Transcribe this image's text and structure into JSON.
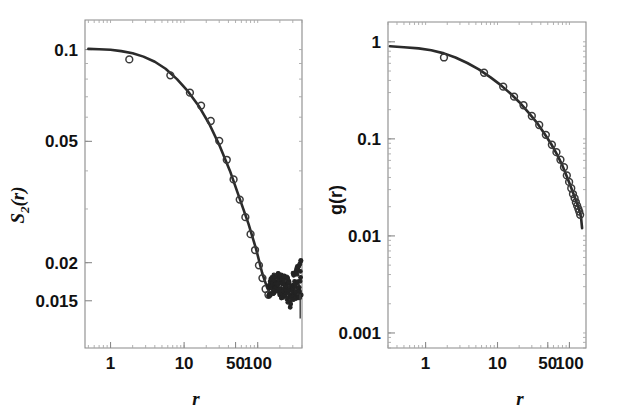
{
  "figure": {
    "title": "",
    "background": "#ffffff",
    "curve_color": "#2b2b2b",
    "marker_color": "#3a3a3a",
    "axis_color": "#8a8a8a"
  },
  "chart_data": [
    {
      "type": "line",
      "panel": "left",
      "title": "",
      "xlabel": "r",
      "ylabel": "S2(r)",
      "ylabel_base": "S",
      "ylabel_sub": "2",
      "ylabel_tail": "(r)",
      "xscale": "log",
      "yscale": "log",
      "xlim": [
        0.45,
        400
      ],
      "ylim": [
        0.0105,
        0.125
      ],
      "grid": false,
      "legend": "none",
      "xticks": [
        1,
        10,
        50,
        100
      ],
      "xticklabels": [
        "1",
        "10",
        "50",
        "100"
      ],
      "yticks": [
        0.1,
        0.05,
        0.02,
        0.015
      ],
      "yticklabels": [
        "0.1",
        "0.05",
        "0.02",
        "0.015"
      ],
      "series": [
        {
          "name": "theory-curve",
          "style": "solid-line",
          "x": [
            0.5,
            0.7,
            1.0,
            1.4,
            2.0,
            2.8,
            4.0,
            5.6,
            8.0,
            11,
            16,
            22,
            30,
            42,
            58,
            75,
            95,
            115,
            135,
            150,
            165,
            185,
            210,
            240,
            270,
            300,
            340,
            380
          ],
          "y": [
            0.1005,
            0.1002,
            0.0998,
            0.0988,
            0.0972,
            0.0948,
            0.0912,
            0.0865,
            0.08,
            0.0735,
            0.065,
            0.057,
            0.0487,
            0.04,
            0.032,
            0.0268,
            0.0222,
            0.0185,
            0.0165,
            0.0158,
            0.0157,
            0.0163,
            0.0166,
            0.0162,
            0.0168,
            0.017,
            0.0172,
            0.0166
          ]
        },
        {
          "name": "simulation-points",
          "style": "open-circles",
          "x": [
            1.8,
            6.5,
            12,
            17,
            23,
            30,
            38,
            47,
            57,
            68,
            80,
            92,
            104,
            116,
            128,
            140
          ],
          "y": [
            0.0928,
            0.0823,
            0.0722,
            0.0655,
            0.0583,
            0.0502,
            0.0435,
            0.0375,
            0.0322,
            0.0282,
            0.0248,
            0.022,
            0.0196,
            0.0178,
            0.0164,
            0.0157
          ]
        },
        {
          "name": "noisy-tail",
          "style": "dense-noisy-markers",
          "x_range": [
            140,
            390
          ],
          "y_range": [
            0.015,
            0.0185
          ],
          "description": "dense scatter plateau with fluctuations"
        }
      ]
    },
    {
      "type": "line",
      "panel": "right",
      "title": "",
      "xlabel": "r",
      "ylabel": "g(r)",
      "xscale": "log",
      "yscale": "log",
      "xlim": [
        0.3,
        170
      ],
      "ylim": [
        0.0007,
        1.6
      ],
      "grid": false,
      "legend": "none",
      "xticks": [
        1,
        10,
        50,
        100
      ],
      "xticklabels": [
        "1",
        "10",
        "50",
        "100"
      ],
      "yticks": [
        1,
        0.1,
        0.01,
        0.001
      ],
      "yticklabels": [
        "1",
        "0.1",
        "0.01",
        "0.001"
      ],
      "series": [
        {
          "name": "theory-curve",
          "style": "solid-line",
          "x": [
            0.32,
            0.5,
            0.8,
            1.2,
            1.8,
            2.6,
            3.8,
            5.5,
            8.0,
            11,
            15,
            20,
            27,
            35,
            45,
            56,
            68,
            80,
            92,
            103,
            112,
            120,
            128,
            134,
            140,
            145,
            150
          ],
          "y": [
            0.9,
            0.88,
            0.855,
            0.82,
            0.76,
            0.69,
            0.605,
            0.52,
            0.43,
            0.36,
            0.295,
            0.24,
            0.186,
            0.148,
            0.113,
            0.088,
            0.068,
            0.053,
            0.041,
            0.033,
            0.028,
            0.0245,
            0.0215,
            0.0195,
            0.0175,
            0.0155,
            0.012
          ]
        },
        {
          "name": "simulation-points",
          "style": "open-circles",
          "x": [
            1.8,
            6.5,
            12,
            17,
            23,
            30,
            38,
            47,
            57,
            66,
            75,
            84,
            92,
            99,
            106,
            112,
            118,
            123,
            128,
            133,
            137,
            141
          ],
          "y": [
            0.69,
            0.48,
            0.345,
            0.272,
            0.222,
            0.172,
            0.139,
            0.11,
            0.087,
            0.073,
            0.061,
            0.051,
            0.042,
            0.036,
            0.031,
            0.027,
            0.0245,
            0.0222,
            0.0205,
            0.019,
            0.0178,
            0.0165
          ]
        }
      ]
    }
  ]
}
